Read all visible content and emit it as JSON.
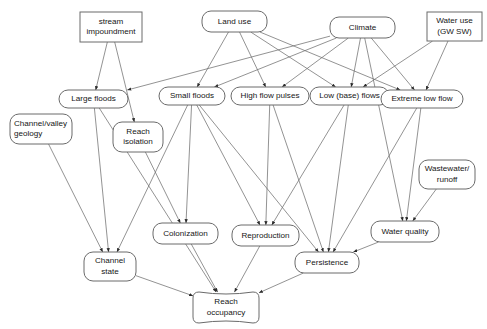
{
  "diagram": {
    "background_color": "#ffffff",
    "node_stroke_color": "#6b6b6b",
    "edge_color": "#6f6f6f",
    "text_color": "#161616",
    "nodes": [
      {
        "id": "stream_impoundment",
        "label_lines": [
          "stream",
          "impoundment"
        ],
        "shape": "rect",
        "x": 80,
        "y": 12,
        "w": 62,
        "h": 30,
        "align": "center"
      },
      {
        "id": "land_use",
        "label_lines": [
          "Land use"
        ],
        "shape": "rounded",
        "x": 202,
        "y": 11,
        "w": 65,
        "h": 21,
        "align": "center"
      },
      {
        "id": "climate",
        "label_lines": [
          "Climate"
        ],
        "shape": "rounded",
        "x": 330,
        "y": 17,
        "w": 65,
        "h": 21,
        "align": "center"
      },
      {
        "id": "water_use",
        "label_lines": [
          "Water use",
          "(GW SW)"
        ],
        "shape": "rect",
        "x": 427,
        "y": 12,
        "w": 55,
        "h": 29,
        "align": "center"
      },
      {
        "id": "large_floods",
        "label_lines": [
          "Large floods"
        ],
        "shape": "rounded",
        "x": 59,
        "y": 90,
        "w": 69,
        "h": 18,
        "align": "center"
      },
      {
        "id": "small_floods",
        "label_lines": [
          "Small floods"
        ],
        "shape": "rounded",
        "x": 159,
        "y": 87,
        "w": 66,
        "h": 18,
        "align": "center"
      },
      {
        "id": "high_flow_pulses",
        "label_lines": [
          "High flow pulses"
        ],
        "shape": "rounded",
        "x": 231,
        "y": 87,
        "w": 78,
        "h": 18,
        "align": "center"
      },
      {
        "id": "low_base_flows",
        "label_lines": [
          "Low (base) flows"
        ],
        "shape": "rounded",
        "x": 310,
        "y": 87,
        "w": 79,
        "h": 18,
        "align": "center"
      },
      {
        "id": "extreme_low_flow",
        "label_lines": [
          "Extreme low flow"
        ],
        "shape": "rounded",
        "x": 381,
        "y": 90,
        "w": 82,
        "h": 18,
        "align": "center"
      },
      {
        "id": "channel_valley_geology",
        "label_lines": [
          "Channel/valley",
          "geology"
        ],
        "shape": "rounded",
        "x": 10,
        "y": 114,
        "w": 62,
        "h": 30,
        "align": "start"
      },
      {
        "id": "reach_isolation",
        "label_lines": [
          "Reach",
          "isolation"
        ],
        "shape": "rounded",
        "x": 113,
        "y": 122,
        "w": 50,
        "h": 30,
        "align": "center"
      },
      {
        "id": "wastewater_runoff",
        "label_lines": [
          "Wastewater/",
          "runoff"
        ],
        "shape": "rounded",
        "x": 419,
        "y": 160,
        "w": 56,
        "h": 29,
        "align": "center"
      },
      {
        "id": "colonization",
        "label_lines": [
          "Colonization"
        ],
        "shape": "rounded",
        "x": 153,
        "y": 223,
        "w": 65,
        "h": 21,
        "align": "center"
      },
      {
        "id": "reproduction",
        "label_lines": [
          "Reproduction"
        ],
        "shape": "rounded",
        "x": 232,
        "y": 225,
        "w": 67,
        "h": 21,
        "align": "center"
      },
      {
        "id": "water_quality",
        "label_lines": [
          "Water quality"
        ],
        "shape": "rounded",
        "x": 371,
        "y": 221,
        "w": 68,
        "h": 21,
        "align": "center"
      },
      {
        "id": "persistence",
        "label_lines": [
          "Persistence"
        ],
        "shape": "rounded",
        "x": 295,
        "y": 252,
        "w": 64,
        "h": 21,
        "align": "center"
      },
      {
        "id": "channel_state",
        "label_lines": [
          "Channel",
          "state"
        ],
        "shape": "rounded",
        "x": 84,
        "y": 252,
        "w": 52,
        "h": 29,
        "align": "center"
      },
      {
        "id": "reach_occupancy",
        "label_lines": [
          "Reach",
          "occupancy"
        ],
        "shape": "flag",
        "x": 193,
        "y": 292,
        "w": 66,
        "h": 31,
        "align": "center"
      }
    ],
    "edges": [
      {
        "from": "stream_impoundment",
        "to": "large_floods"
      },
      {
        "from": "stream_impoundment",
        "to": "reach_isolation"
      },
      {
        "from": "land_use",
        "to": "small_floods"
      },
      {
        "from": "land_use",
        "to": "high_flow_pulses"
      },
      {
        "from": "land_use",
        "to": "low_base_flows"
      },
      {
        "from": "land_use",
        "to": "extreme_low_flow"
      },
      {
        "from": "climate",
        "to": "large_floods"
      },
      {
        "from": "climate",
        "to": "small_floods"
      },
      {
        "from": "climate",
        "to": "high_flow_pulses"
      },
      {
        "from": "climate",
        "to": "low_base_flows"
      },
      {
        "from": "climate",
        "to": "extreme_low_flow"
      },
      {
        "from": "climate",
        "to": "water_quality"
      },
      {
        "from": "water_use",
        "to": "low_base_flows"
      },
      {
        "from": "water_use",
        "to": "extreme_low_flow"
      },
      {
        "from": "large_floods",
        "to": "channel_state"
      },
      {
        "from": "large_floods",
        "to": "reach_occupancy"
      },
      {
        "from": "channel_valley_geology",
        "to": "channel_state"
      },
      {
        "from": "small_floods",
        "to": "channel_state"
      },
      {
        "from": "small_floods",
        "to": "colonization"
      },
      {
        "from": "small_floods",
        "to": "reproduction"
      },
      {
        "from": "small_floods",
        "to": "persistence"
      },
      {
        "from": "reach_isolation",
        "to": "colonization"
      },
      {
        "from": "high_flow_pulses",
        "to": "reproduction"
      },
      {
        "from": "high_flow_pulses",
        "to": "persistence"
      },
      {
        "from": "low_base_flows",
        "to": "reproduction"
      },
      {
        "from": "low_base_flows",
        "to": "persistence"
      },
      {
        "from": "extreme_low_flow",
        "to": "persistence"
      },
      {
        "from": "extreme_low_flow",
        "to": "water_quality"
      },
      {
        "from": "wastewater_runoff",
        "to": "water_quality"
      },
      {
        "from": "colonization",
        "to": "reach_occupancy"
      },
      {
        "from": "reproduction",
        "to": "reach_occupancy"
      },
      {
        "from": "persistence",
        "to": "reach_occupancy"
      },
      {
        "from": "channel_state",
        "to": "reach_occupancy"
      },
      {
        "from": "water_quality",
        "to": "persistence"
      }
    ]
  }
}
